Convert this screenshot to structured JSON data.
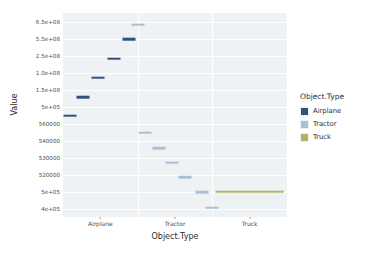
{
  "chart_data": {
    "type": "scatter",
    "title": "",
    "xlabel": "Object.Type",
    "ylabel": "Value",
    "categories": [
      "Airplane",
      "Tractor",
      "Truck"
    ],
    "ytick_labels": [
      "6.5e+08",
      "5.5e+08",
      "2.5e+08",
      "1.0e+08",
      "1.5e+08",
      "5e+05",
      "560000",
      "540000",
      "530000",
      "520000",
      "5e+05",
      "4e+05"
    ],
    "grid": true,
    "legend_position": "right",
    "legend_title": "Object.Type",
    "series": [
      {
        "name": "Airplane",
        "color": "#31527d",
        "points": [
          {
            "category": "Airplane",
            "x_offset": 0.09,
            "y_label": "5e+05",
            "y_index": 5.55
          },
          {
            "category": "Airplane",
            "x_offset": 0.27,
            "y_label": "1.5e+08",
            "y_index": 4.45
          },
          {
            "category": "Airplane",
            "x_offset": 0.47,
            "y_label": "1.0e+08",
            "y_index": 3.3
          },
          {
            "category": "Airplane",
            "x_offset": 0.68,
            "y_label": "2.5e+08",
            "y_index": 2.2
          },
          {
            "category": "Airplane",
            "x_offset": 0.88,
            "y_label": "5.5e+08",
            "y_index": 1.05
          }
        ]
      },
      {
        "name": "Tractor",
        "color": "#a8c0d8",
        "points": [
          {
            "category": "Airplane",
            "x_offset": 1.0,
            "y_label": "6.5e+08",
            "y_index": 0.18
          },
          {
            "category": "Tractor",
            "x_offset": 0.1,
            "y_label": "560000",
            "y_index": 6.55
          },
          {
            "category": "Tractor",
            "x_offset": 0.28,
            "y_label": "540000",
            "y_index": 7.45
          },
          {
            "category": "Tractor",
            "x_offset": 0.46,
            "y_label": "530000",
            "y_index": 8.3
          },
          {
            "category": "Tractor",
            "x_offset": 0.64,
            "y_label": "520000",
            "y_index": 9.15
          },
          {
            "category": "Tractor",
            "x_offset": 0.86,
            "y_label": "5e+05",
            "y_index": 10.05
          },
          {
            "category": "Tractor",
            "x_offset": 1.0,
            "y_label": "4e+05",
            "y_index": 10.95
          }
        ]
      },
      {
        "name": "Truck",
        "color": "#b3b16a",
        "points": [
          {
            "category": "Truck",
            "x_offset": 0.5,
            "y_label": "5e+05",
            "y_index": 10.0,
            "width": 0.92
          }
        ]
      }
    ],
    "legend_entries": [
      {
        "label": "Airplane",
        "color": "#31527d"
      },
      {
        "label": "Tractor",
        "color": "#a8c0d8"
      },
      {
        "label": "Truck",
        "color": "#b3b16a"
      }
    ]
  }
}
